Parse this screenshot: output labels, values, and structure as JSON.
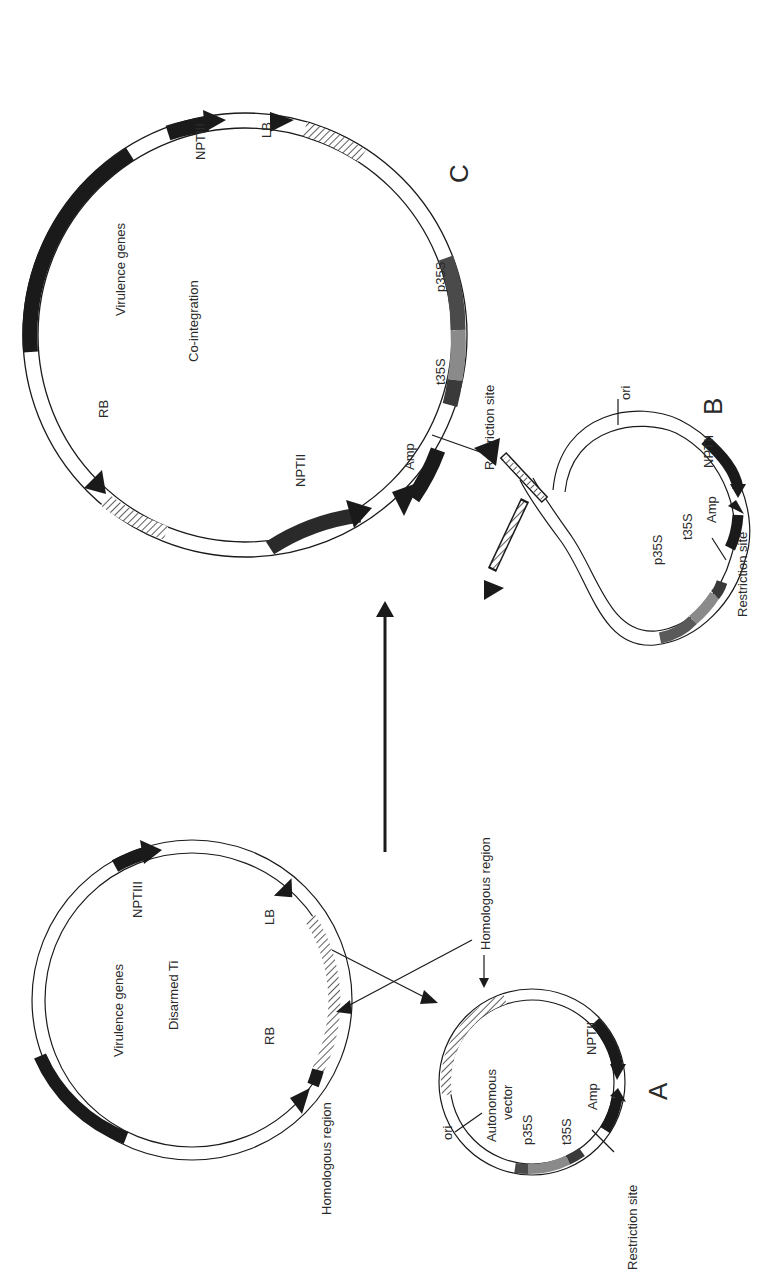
{
  "figure": {
    "orientation": "rotated 90deg counter-clockwise",
    "arrow_direction": "A + B -> C",
    "colors": {
      "ink": "#1a1a1a",
      "dark_grey": "#555555",
      "mid_grey": "#8a8a8a",
      "background": "#ffffff"
    }
  },
  "plasmid_c": {
    "letter": "C",
    "title": "Co-integration",
    "virulence_label": "Virulence genes",
    "labels": {
      "rb": "RB",
      "lb": "LB",
      "nptiii": "NPTIII",
      "nptii": "NPTII",
      "amp": "Amp",
      "p35s": "p35S",
      "t35s": "t35S",
      "restriction_site": "Restriction site"
    }
  },
  "plasmid_b": {
    "letter": "B",
    "labels": {
      "ori": "ori",
      "nptii": "NPTII",
      "amp": "Amp",
      "t35s": "t35S",
      "p35s": "p35S",
      "restriction_site": "Restriction site"
    }
  },
  "disarmed_ti": {
    "title": "Disarmed Ti",
    "virulence_label": "Virulence genes",
    "labels": {
      "nptiii": "NPTIII",
      "lb": "LB",
      "rb": "RB",
      "homologous_region": "Homologous region"
    }
  },
  "plasmid_a": {
    "letter": "A",
    "title_line1": "Autonomous",
    "title_line2": "vector",
    "labels": {
      "homologous_region": "Homologous region",
      "ori": "ori",
      "p35s": "p35S",
      "t35s": "t35S",
      "amp": "Amp",
      "nptii": "NPTII",
      "restriction_site": "Restriction site"
    }
  }
}
